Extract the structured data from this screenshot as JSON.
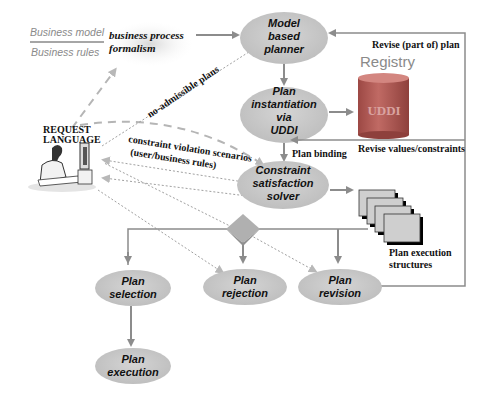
{
  "legend": {
    "business_model": "Business model",
    "business_rules": "Business rules",
    "cloud_line1": "business process",
    "cloud_line2": "formalism"
  },
  "actor": {
    "line1": "REQUEST",
    "line2": "LANGUAGE"
  },
  "nodes": {
    "model_planner": [
      "Model",
      "based",
      "planner"
    ],
    "plan_instantiation": [
      "Plan",
      "instantiation",
      "via",
      "UDDI"
    ],
    "constraint_solver": [
      "Constraint",
      "satisfaction",
      "solver"
    ],
    "plan_selection": [
      "Plan",
      "selection"
    ],
    "plan_rejection": [
      "Plan",
      "rejection"
    ],
    "plan_revision": [
      "Plan",
      "revision"
    ],
    "plan_execution": [
      "Plan",
      "execution"
    ]
  },
  "registry": {
    "title": "Registry",
    "db_label": "UDDI"
  },
  "edge_labels": {
    "no_admissible": "no-admissible plans",
    "constraint_violation_line1": "constraint violation scenarios",
    "constraint_violation_line2": "(user/business rules)",
    "plan_binding": "Plan binding",
    "revise_plan": "Revise (part of) plan",
    "revise_values": "Revise values/constraints",
    "plan_exec_structures_line1": "Plan execution",
    "plan_exec_structures_line2": "structures"
  },
  "colors": {
    "node_fill": "#c9c9c9",
    "arrow": "#8c8c8c",
    "dotted": "#a0a0a0",
    "dashed": "#b5b5b5",
    "cylinder": "#b85a55",
    "frame": "#8c8c8c"
  }
}
